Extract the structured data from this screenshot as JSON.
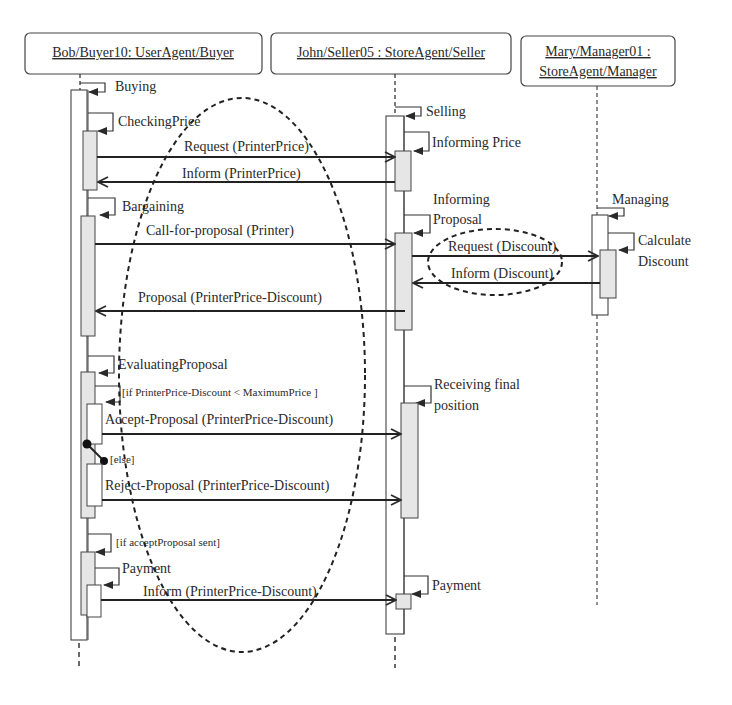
{
  "diagram": {
    "type": "UML sequence diagram",
    "colors": {
      "line": "#2a2a2a",
      "activation_fill": "#e6e6e6",
      "background": "#ffffff"
    },
    "lifelines": [
      {
        "id": "buyer",
        "label": "Bob/Buyer10: UserAgent/Buyer"
      },
      {
        "id": "seller",
        "label": "John/Seller05 : StoreAgent/Seller"
      },
      {
        "id": "manager",
        "label_line1": "Mary/Manager01 :",
        "label_line2": "StoreAgent/Manager"
      }
    ],
    "states": {
      "buying": "Buying",
      "checking_price": "CheckingPrice",
      "bargaining": "Bargaining",
      "evaluating_proposal": "EvaluatingProposal",
      "payment_buyer": "Payment",
      "selling": "Selling",
      "informing_price": "Informing Price",
      "informing_proposal_1": "Informing",
      "informing_proposal_2": "Proposal",
      "receiving_final_1": "Receiving final",
      "receiving_final_2": "position",
      "payment_seller": "Payment",
      "managing": "Managing",
      "calculate_discount_1": "Calculate",
      "calculate_discount_2": "Discount"
    },
    "guards": {
      "accept_condition": "[if PrinterPrice-Discount < MaximumPrice ]",
      "else": "[else]",
      "if_accept_sent": "[if acceptProposal sent]"
    },
    "messages": [
      {
        "label": "Request (PrinterPrice)",
        "from": "buyer",
        "to": "seller"
      },
      {
        "label": "Inform (PrinterPrice)",
        "from": "seller",
        "to": "buyer"
      },
      {
        "label": "Call-for-proposal (Printer)",
        "from": "buyer",
        "to": "seller"
      },
      {
        "label": "Request (Discount)",
        "from": "seller",
        "to": "manager"
      },
      {
        "label": "Inform (Discount)",
        "from": "manager",
        "to": "seller"
      },
      {
        "label": "Proposal (PrinterPrice-Discount)",
        "from": "seller",
        "to": "buyer"
      },
      {
        "label": "Accept-Proposal (PrinterPrice-Discount)",
        "from": "buyer",
        "to": "seller"
      },
      {
        "label": "Reject-Proposal (PrinterPrice-Discount)",
        "from": "buyer",
        "to": "seller"
      },
      {
        "label": "Inform (PrinterPrice-Discount)",
        "from": "buyer",
        "to": "seller"
      }
    ],
    "highlights": [
      {
        "shape": "dashed-ellipse",
        "region": "buyer-seller interaction"
      },
      {
        "shape": "dashed-ellipse",
        "region": "seller-manager discount exchange"
      }
    ]
  }
}
